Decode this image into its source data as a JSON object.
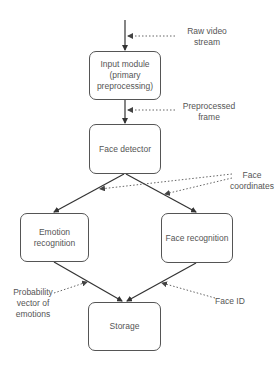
{
  "diagram": {
    "nodes": [
      {
        "id": "input",
        "label": "Input module (primary preprocessing)"
      },
      {
        "id": "detector",
        "label": "Face detector"
      },
      {
        "id": "emotion",
        "label": "Emotion recognition"
      },
      {
        "id": "recognition",
        "label": "Face recognition"
      },
      {
        "id": "storage",
        "label": "Storage"
      }
    ],
    "annotations": [
      {
        "id": "raw",
        "label": "Raw video\nstream"
      },
      {
        "id": "preprocessed",
        "label": "Preprocessed\nframe"
      },
      {
        "id": "coords",
        "label": "Face\ncoordinates"
      },
      {
        "id": "prob",
        "label": "Probability\nvector of\nemotions"
      },
      {
        "id": "faceid",
        "label": "Face ID"
      }
    ],
    "edges": [
      {
        "from": "source",
        "to": "input",
        "annotation": "raw"
      },
      {
        "from": "input",
        "to": "detector",
        "annotation": "preprocessed"
      },
      {
        "from": "detector",
        "to": "emotion",
        "annotation": "coords"
      },
      {
        "from": "detector",
        "to": "recognition",
        "annotation": "coords"
      },
      {
        "from": "emotion",
        "to": "storage",
        "annotation": "prob"
      },
      {
        "from": "recognition",
        "to": "storage",
        "annotation": "faceid"
      }
    ]
  }
}
